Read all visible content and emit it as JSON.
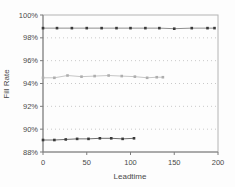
{
  "chart_data": {
    "type": "line",
    "title": "",
    "xlabel": "Leadtime",
    "ylabel": "Fill Rate",
    "xlim": [
      0,
      200
    ],
    "ylim": [
      88,
      100
    ],
    "x_ticks": [
      0,
      50,
      100,
      150,
      200
    ],
    "x_tick_labels": [
      "0",
      "50",
      "100",
      "150",
      "200"
    ],
    "y_ticks": [
      88,
      90,
      92,
      94,
      96,
      98,
      100
    ],
    "y_tick_labels": [
      "88%",
      "90%",
      "92%",
      "94%",
      "96%",
      "98%",
      "100%"
    ],
    "grid": "horizontal dotted lines at each 2% tick",
    "legend": "none",
    "colors": {
      "grid": "#c9c9c9",
      "plot_border": "#b4b4b4",
      "axis": "#7d7d7d",
      "text": "#4a4a4a"
    },
    "series": [
      {
        "name": "high-fill-rate-line",
        "marker": "square",
        "marker_color": "#3a3a3a",
        "line_color": "#8f8f8f",
        "x": [
          0,
          16,
          33,
          50,
          67,
          84,
          100,
          117,
          133,
          150,
          170,
          188,
          196
        ],
        "y": [
          98.85,
          98.85,
          98.85,
          98.85,
          98.85,
          98.85,
          98.85,
          98.85,
          98.85,
          98.8,
          98.85,
          98.85,
          98.85
        ]
      },
      {
        "name": "mid-fill-rate-line",
        "marker": "square",
        "marker_color": "#aeaeae",
        "line_color": "#c6c6c6",
        "x": [
          0,
          13,
          28,
          44,
          59,
          75,
          90,
          105,
          119,
          130,
          137
        ],
        "y": [
          94.5,
          94.5,
          94.7,
          94.6,
          94.65,
          94.7,
          94.65,
          94.6,
          94.5,
          94.55,
          94.55
        ]
      },
      {
        "name": "low-fill-rate-line",
        "marker": "square",
        "marker_color": "#3a3a3a",
        "line_color": "#6f6f6f",
        "x": [
          0,
          13,
          26,
          39,
          52,
          65,
          78,
          91,
          104
        ],
        "y": [
          89.05,
          89.05,
          89.1,
          89.15,
          89.15,
          89.2,
          89.2,
          89.15,
          89.2
        ]
      }
    ]
  }
}
